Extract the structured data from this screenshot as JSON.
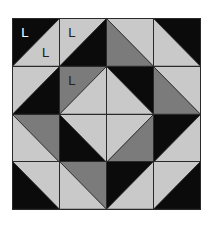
{
  "figure": {
    "grid": {
      "rows": 4,
      "cols": 4
    },
    "colors": {
      "black": "#0b0b0b",
      "dark": "#7b7b7b",
      "light": "#c9c9c9",
      "border": "#2a2a2a"
    },
    "cells": [
      {
        "row": 0,
        "col": 0,
        "diagonal": "/",
        "a": "black",
        "b": "light",
        "labels": [
          {
            "text": "L",
            "pos": "a",
            "color": "#ffffff"
          },
          {
            "text": "L",
            "pos": "b",
            "color": "#222222"
          }
        ]
      },
      {
        "row": 0,
        "col": 1,
        "diagonal": "/",
        "a": "light",
        "b": "black",
        "labels": [
          {
            "text": "L",
            "pos": "a",
            "color": "#222222"
          }
        ]
      },
      {
        "row": 0,
        "col": 2,
        "diagonal": "\\",
        "a": "light",
        "b": "dark",
        "labels": []
      },
      {
        "row": 0,
        "col": 3,
        "diagonal": "\\",
        "a": "black",
        "b": "light",
        "labels": []
      },
      {
        "row": 1,
        "col": 0,
        "diagonal": "/",
        "a": "light",
        "b": "black",
        "labels": []
      },
      {
        "row": 1,
        "col": 1,
        "diagonal": "/",
        "a": "dark",
        "b": "light",
        "labels": [
          {
            "text": "L",
            "pos": "a",
            "color": "#222222"
          }
        ]
      },
      {
        "row": 1,
        "col": 2,
        "diagonal": "\\",
        "a": "black",
        "b": "light",
        "labels": []
      },
      {
        "row": 1,
        "col": 3,
        "diagonal": "\\",
        "a": "light",
        "b": "dark",
        "labels": []
      },
      {
        "row": 2,
        "col": 0,
        "diagonal": "\\",
        "a": "dark",
        "b": "light",
        "labels": []
      },
      {
        "row": 2,
        "col": 1,
        "diagonal": "\\",
        "a": "light",
        "b": "black",
        "labels": []
      },
      {
        "row": 2,
        "col": 2,
        "diagonal": "/",
        "a": "light",
        "b": "dark",
        "labels": []
      },
      {
        "row": 2,
        "col": 3,
        "diagonal": "/",
        "a": "black",
        "b": "light",
        "labels": []
      },
      {
        "row": 3,
        "col": 0,
        "diagonal": "\\",
        "a": "light",
        "b": "black",
        "labels": []
      },
      {
        "row": 3,
        "col": 1,
        "diagonal": "\\",
        "a": "dark",
        "b": "light",
        "labels": []
      },
      {
        "row": 3,
        "col": 2,
        "diagonal": "/",
        "a": "black",
        "b": "light",
        "labels": []
      },
      {
        "row": 3,
        "col": 3,
        "diagonal": "/",
        "a": "light",
        "b": "black",
        "labels": []
      }
    ],
    "legend_note": "For '/' cells: a = top-left triangle, b = bottom-right triangle. For '\\' cells: a = top-right triangle, b = bottom-left triangle."
  }
}
